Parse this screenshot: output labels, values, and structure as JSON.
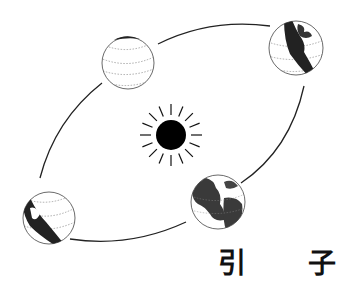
{
  "title": {
    "chars": [
      "引",
      "子"
    ]
  },
  "diagram": {
    "sun": {
      "cx": 171,
      "cy": 135,
      "r": 15,
      "ray_inner": 20,
      "ray_outer": 31,
      "ray_count": 16,
      "color": "#000000"
    },
    "orbit": {
      "cx": 171,
      "cy": 135,
      "rx": 160,
      "ry": 80,
      "rotation": -30,
      "stroke": "#222222"
    },
    "globes": [
      {
        "name": "globe-top-left",
        "cx": 128,
        "cy": 63,
        "r": 26,
        "shade": "none"
      },
      {
        "name": "globe-top-right",
        "cx": 296,
        "cy": 48,
        "r": 27,
        "shade": "left"
      },
      {
        "name": "globe-bottom-right",
        "cx": 218,
        "cy": 202,
        "r": 27,
        "shade": "full"
      },
      {
        "name": "globe-bottom-left",
        "cx": 49,
        "cy": 218,
        "r": 26,
        "shade": "left"
      }
    ]
  },
  "colors": {
    "ink": "#111111",
    "land": "#3a3a3a",
    "background": "#ffffff"
  }
}
